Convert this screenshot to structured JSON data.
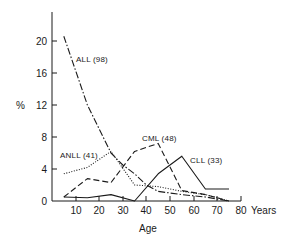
{
  "chart_data": {
    "type": "line",
    "title": "",
    "xlabel": "Age",
    "ylabel": "%",
    "x_unit_label": "Years",
    "xlim": [
      0,
      80
    ],
    "ylim": [
      0,
      23
    ],
    "x_ticks": [
      10,
      20,
      30,
      40,
      50,
      60,
      70,
      80
    ],
    "y_ticks": [
      0,
      4,
      8,
      12,
      16,
      20
    ],
    "grid": false,
    "legend": "inline labels",
    "series": [
      {
        "name": "ALL (98)",
        "style": "dash-dot",
        "x": [
          5,
          15,
          25,
          30,
          35,
          40,
          45,
          55,
          65,
          75
        ],
        "values": [
          20.6,
          12.0,
          6.0,
          4.5,
          3.4,
          2.0,
          1.2,
          0.8,
          0.5,
          0.0
        ]
      },
      {
        "name": "ANLL (41)",
        "style": "dotted",
        "x": [
          5,
          15,
          25,
          35,
          45,
          55,
          65,
          75
        ],
        "values": [
          3.4,
          4.2,
          6.2,
          2.0,
          1.8,
          1.2,
          0.8,
          0.0
        ]
      },
      {
        "name": "CML (48)",
        "style": "dashed",
        "x": [
          5,
          15,
          25,
          35,
          45,
          55,
          65,
          75
        ],
        "values": [
          0.5,
          2.8,
          2.3,
          6.2,
          7.2,
          1.3,
          0.8,
          0.0
        ]
      },
      {
        "name": "CLL (33)",
        "style": "solid",
        "x": [
          5,
          15,
          25,
          35,
          45,
          55,
          65,
          75
        ],
        "values": [
          0.5,
          0.4,
          0.8,
          0.0,
          3.4,
          5.6,
          1.5,
          1.5
        ]
      }
    ]
  },
  "labels": {
    "y_axis_symbol": "%",
    "x_axis_title": "Age",
    "x_unit": "Years",
    "y_ticks": [
      "20",
      "16",
      "12",
      "8",
      "4",
      "0"
    ],
    "x_ticks": [
      "10",
      "20",
      "30",
      "40",
      "50",
      "60",
      "70",
      "80"
    ],
    "series_all": "ALL (98)",
    "series_anll": "ANLL (41)",
    "series_cml": "CML (48)",
    "series_cll": "CLL (33)"
  }
}
